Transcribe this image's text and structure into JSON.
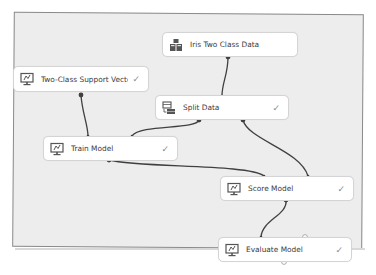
{
  "canvas": {
    "background": "#ededed",
    "border": "#8a8a8a"
  },
  "nodes": [
    {
      "id": "iris",
      "label": "Iris Two Class Data",
      "icon": "dataset-icon",
      "status": ""
    },
    {
      "id": "svm",
      "label": "Two-Class Support Vector M...",
      "icon": "model-icon",
      "status": "✓"
    },
    {
      "id": "split",
      "label": "Split Data",
      "icon": "split-data-icon",
      "status": "✓"
    },
    {
      "id": "train",
      "label": "Train Model",
      "icon": "model-icon",
      "status": "✓"
    },
    {
      "id": "score",
      "label": "Score Model",
      "icon": "model-icon",
      "status": "✓"
    },
    {
      "id": "evaluate",
      "label": "Evaluate Model",
      "icon": "model-icon",
      "status": "✓"
    }
  ],
  "edges": [
    {
      "from": "Iris Two Class Data",
      "to": "Split Data"
    },
    {
      "from": "Two-Class Support Vector M...",
      "to": "Train Model"
    },
    {
      "from": "Split Data",
      "to": "Train Model"
    },
    {
      "from": "Split Data",
      "to": "Score Model"
    },
    {
      "from": "Train Model",
      "to": "Score Model"
    },
    {
      "from": "Score Model",
      "to": "Evaluate Model"
    }
  ]
}
